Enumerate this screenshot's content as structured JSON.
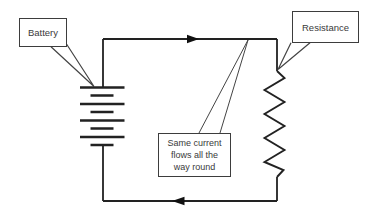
{
  "diagram": {
    "background": "#ffffff",
    "line_color": "#222222",
    "text_color": "#3a3a3a",
    "battery": {
      "label": "Battery",
      "symbol": "battery-cells"
    },
    "resistor": {
      "label": "Resistance",
      "symbol": "zigzag-resistor"
    },
    "note": {
      "lines": [
        "Same current",
        "flows all the",
        "way round"
      ]
    },
    "current": {
      "top_arrow_direction": "right",
      "bottom_arrow_direction": "left"
    }
  }
}
